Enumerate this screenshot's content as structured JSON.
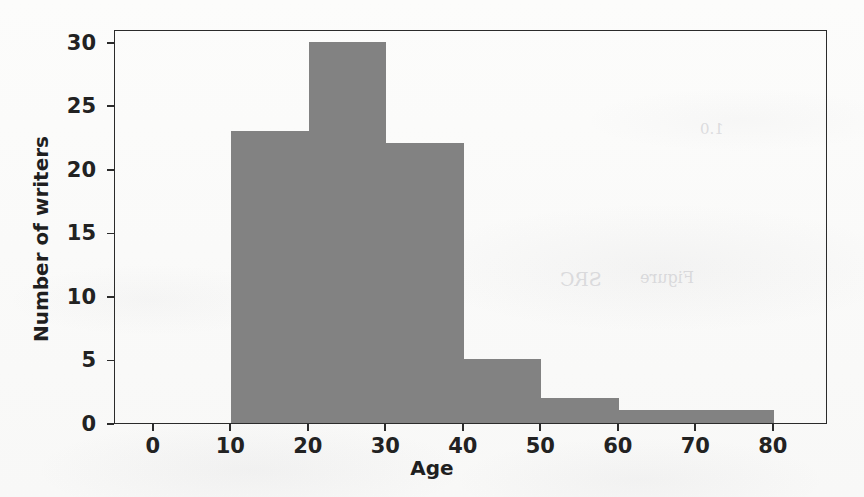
{
  "chart_data": {
    "type": "bar",
    "title": "",
    "subtitle": "",
    "xlabel": "Age",
    "ylabel": "Number of writers",
    "xlim": [
      -5,
      87
    ],
    "ylim": [
      0,
      31
    ],
    "grid": false,
    "legend": null,
    "bar_color": "#828282",
    "axis_color": "#2b2b2b",
    "bin_edges": [
      10,
      20,
      30,
      40,
      50,
      60,
      70,
      80
    ],
    "categories": [
      "10-20",
      "20-30",
      "30-40",
      "40-50",
      "50-60",
      "60-70",
      "70-80"
    ],
    "values": [
      23,
      30,
      22,
      5,
      2,
      1,
      1
    ],
    "xticks": [
      0,
      10,
      20,
      30,
      40,
      50,
      60,
      70,
      80
    ],
    "xtick_labels": [
      "0",
      "10",
      "20",
      "30",
      "40",
      "50",
      "60",
      "70",
      "80"
    ],
    "yticks": [
      0,
      5,
      10,
      15,
      20,
      25,
      30
    ],
    "ytick_labels": [
      "0",
      "5",
      "10",
      "15",
      "20",
      "25",
      "30"
    ]
  },
  "background": {
    "ghost_texts": [
      {
        "text": "1.0",
        "x": 700,
        "y": 120,
        "size": 15
      },
      {
        "text": "SRC",
        "x": 560,
        "y": 268,
        "size": 19
      },
      {
        "text": "Ratio",
        "x": 420,
        "y": 290,
        "size": 16
      },
      {
        "text": "Average",
        "x": 360,
        "y": 345,
        "size": 16
      },
      {
        "text": "Figure",
        "x": 640,
        "y": 268,
        "size": 16
      }
    ]
  }
}
